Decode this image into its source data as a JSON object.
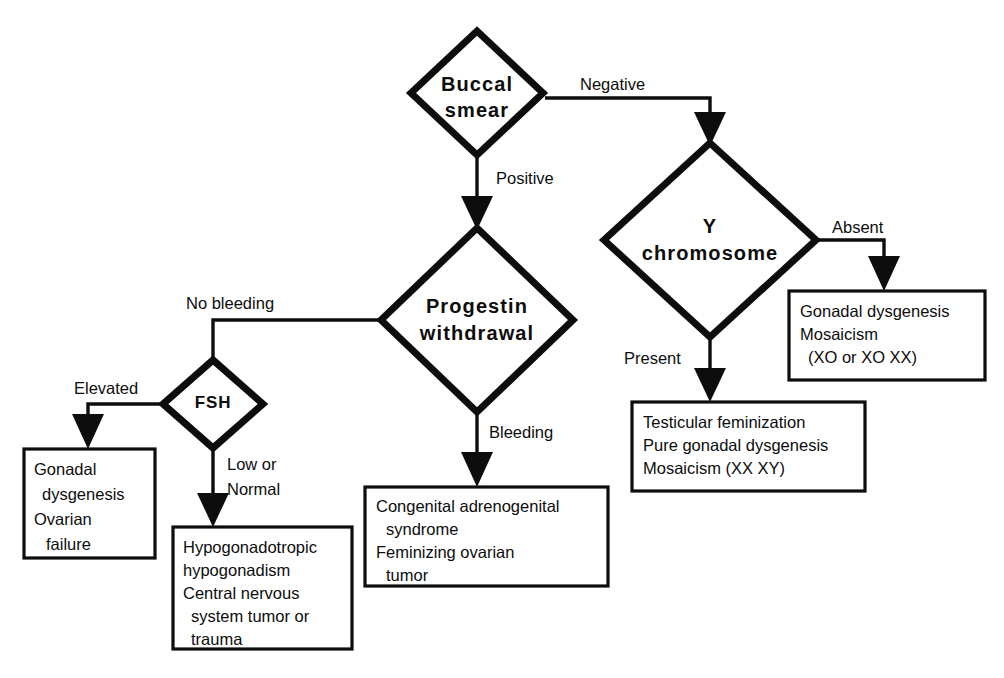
{
  "diagram": {
    "type": "decision-flowchart",
    "colors": {
      "stroke": "#0d0d0d",
      "fill": "#ffffff",
      "background": "#ffffff"
    }
  },
  "nodes": {
    "buccal_smear": {
      "line1": "Buccal",
      "line2": "smear"
    },
    "y_chromosome": {
      "line1": "Y",
      "line2": "chromosome"
    },
    "progestin_withdrawal": {
      "line1": "Progestin",
      "line2": "withdrawal"
    },
    "fsh": {
      "line1": "FSH"
    }
  },
  "edge_labels": {
    "negative": "Negative",
    "positive": "Positive",
    "absent": "Absent",
    "present": "Present",
    "no_bleeding": "No bleeding",
    "bleeding": "Bleeding",
    "elevated": "Elevated",
    "low_or_normal_line1": "Low or",
    "low_or_normal_line2": "Normal"
  },
  "outcome_boxes": {
    "gonadal_dysgenesis_mosaicism": {
      "line1": "Gonadal dysgenesis",
      "line2": "Mosaicism",
      "line3": "(XO or XO XX)"
    },
    "testicular_feminization": {
      "line1": "Testicular  feminization",
      "line2": "Pure gonadal dysgenesis",
      "line3": "Mosaicism (XX XY)"
    },
    "congenital_adrenogenital": {
      "line1": "Congenital adrenogenital",
      "line2": "syndrome",
      "line3": "Feminizing  ovarian",
      "line4": "tumor"
    },
    "gonadal_dysgenesis_ovarian_failure": {
      "line1": "Gonadal",
      "line2": "dysgenesis",
      "line3": "Ovarian",
      "line4": "failure"
    },
    "hypogonadotropic": {
      "line1": "Hypogonadotropic",
      "line2": "hypogonadism",
      "line3": "Central  nervous",
      "line4": "system tumor or",
      "line5": "trauma"
    }
  }
}
